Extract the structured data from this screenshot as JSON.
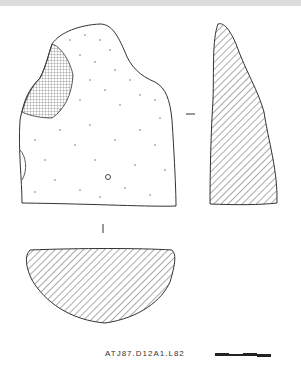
{
  "figure": {
    "label": "ATJ87.D12A1.L82",
    "views": [
      "front-view",
      "side-section",
      "cross-section"
    ],
    "scale_bar": {
      "segments": 4
    }
  },
  "colors": {
    "ink": "#333333",
    "background": "#ffffff",
    "top_band": "#dcdcdc"
  }
}
